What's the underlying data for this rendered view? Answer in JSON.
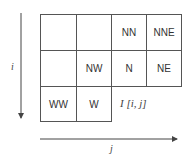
{
  "diagram": {
    "axis_i_label": "i",
    "axis_j_label": "j",
    "current_pixel_label": "I [i, j]",
    "rows": [
      [
        "",
        "",
        "NN",
        "NNE"
      ],
      [
        "",
        "NW",
        "N",
        "NE"
      ],
      [
        "WW",
        "W",
        null,
        null
      ]
    ]
  }
}
